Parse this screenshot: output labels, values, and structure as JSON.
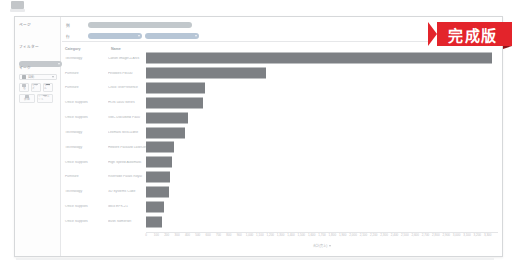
{
  "app": {
    "glyph_name": "app-logo-glyph"
  },
  "badge": {
    "text": "完成版",
    "color": "#e3242b"
  },
  "sidebar": {
    "cards": [
      {
        "title": "ページ",
        "pill": ""
      },
      {
        "title": "フィルター",
        "pill": "SUB-Category"
      },
      {
        "title": "マーク",
        "pill": ""
      }
    ],
    "pages_title": "ページ",
    "filters_title": "フィルター",
    "filters_pill_label": "SUB-Category",
    "marks_title": "マーク",
    "marks_type_label": "自動",
    "marks_buttons": [
      {
        "name": "color",
        "label": "色"
      },
      {
        "name": "size",
        "label": "サイズ"
      },
      {
        "name": "label",
        "label": "ラベル"
      },
      {
        "name": "detail",
        "label": "詳細"
      },
      {
        "name": "tooltip",
        "label": "ツールヒント"
      }
    ]
  },
  "shelves": {
    "columns_label": "列",
    "rows_label": "行",
    "columns_pills": [
      {
        "label": "合計(Sales)",
        "color": "green"
      }
    ],
    "rows_pills": [
      {
        "label": "Category",
        "color": "blue"
      },
      {
        "label": "Name",
        "color": "blue"
      }
    ]
  },
  "chart_data": {
    "type": "bar",
    "orientation": "horizontal",
    "title": "",
    "xlabel": "合計(売上)",
    "ylabel": "",
    "grid": false,
    "legend": false,
    "xlim": [
      0,
      3400
    ],
    "column_headers": [
      "Category",
      "Name"
    ],
    "categories": [
      "Technology",
      "Furniture",
      "Furniture",
      "Office Supplies",
      "Office Supplies",
      "Technology",
      "Technology",
      "Office Supplies",
      "Furniture",
      "Technology",
      "Office Supplies",
      "Office Supplies"
    ],
    "names": [
      "Canon imageCLASS",
      "Fellowes PB500",
      "Cisco TelePresence",
      "HON 5400 Series",
      "GBC DocuBind P400",
      "Lexmark MX611dhe",
      "Hewlett Packard LaserJet",
      "High Speed Automatic",
      "Riverside Palais Royal",
      "3D Systems Cube",
      "Ibico EPK-21",
      "Bush Somerset"
    ],
    "values": [
      3300,
      1150,
      565,
      545,
      400,
      375,
      270,
      245,
      230,
      215,
      175,
      155
    ],
    "xticks": [
      0,
      100,
      200,
      300,
      400,
      500,
      600,
      700,
      800,
      900,
      1000,
      1100,
      1200,
      1300,
      1400,
      1500,
      1600,
      1700,
      1800,
      1900,
      2000,
      2100,
      2200,
      2300,
      2400,
      2500,
      2600,
      2700,
      2800,
      2900,
      3000,
      3100,
      3200,
      3300
    ],
    "xtick_labels": [
      "0",
      "100",
      "200",
      "300",
      "400",
      "500",
      "600",
      "700",
      "800",
      "900",
      "1,000",
      "1,100",
      "1,200",
      "1,300",
      "1,400",
      "1,500",
      "1,600",
      "1,700",
      "1,800",
      "1,900",
      "2,000",
      "2,100",
      "2,200",
      "2,300",
      "2,400",
      "2,500",
      "2,600",
      "2,700",
      "2,800",
      "2,900",
      "3,000",
      "3,100",
      "3,200",
      "3,300"
    ],
    "bar_color": "#7d8084"
  }
}
